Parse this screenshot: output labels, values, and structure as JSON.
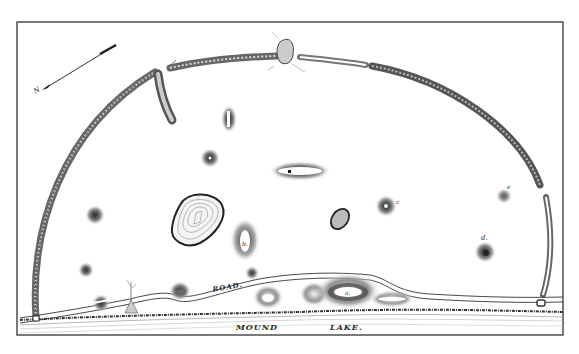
{
  "map": {
    "labels": {
      "road": "ROAD.",
      "mound": "MOUND",
      "lake": "LAKE.",
      "north": "N"
    },
    "mound_letters": {
      "a": "a.",
      "b": "b.",
      "c": "c",
      "d": "d.",
      "e": "e"
    },
    "features": [
      {
        "id": "enclosure-wall",
        "type": "semicircular earthen embankment"
      },
      {
        "id": "gateway-north",
        "type": "gap with mound"
      },
      {
        "id": "large-platform",
        "type": "contoured platform mound"
      },
      {
        "id": "mound-a",
        "type": "large oval mound by lake"
      },
      {
        "id": "mound-b",
        "type": "oval mound"
      },
      {
        "id": "mound-c",
        "type": "conical mound"
      },
      {
        "id": "mound-d",
        "type": "conical mound"
      },
      {
        "id": "mound-e",
        "type": "small conical mound"
      }
    ],
    "colors": {
      "ink": "#2a2a2a",
      "paper": "#ffffff",
      "hatch": "#555555"
    }
  }
}
